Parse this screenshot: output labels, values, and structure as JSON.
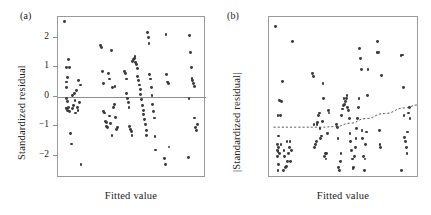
{
  "figure": {
    "background": "#ffffff",
    "point_color": "#3b3b3b",
    "line_color": "#8d8d8d",
    "trend_color": "#5a5a5a"
  },
  "panels": [
    {
      "key": "a",
      "label": "(a)",
      "xlabel": "Fitted value",
      "ylabel": "Standardized residual"
    },
    {
      "key": "b",
      "label": "(b)",
      "xlabel": "Fitted value",
      "ylabel": "|Standardized residual|"
    }
  ],
  "chart_data": [
    {
      "type": "scatter",
      "panel": "(a)",
      "title": "",
      "xlabel": "Fitted value",
      "ylabel": "Standardized residual",
      "xticklabels": [],
      "yticks": [
        -2,
        -1,
        0,
        1,
        2
      ],
      "yticklabels": [
        "−2",
        "−1",
        "0",
        "1",
        "2"
      ],
      "ylim": [
        -2.75,
        2.7
      ],
      "xlim": [
        0,
        1
      ],
      "grid": false,
      "legend": null,
      "reference_line": {
        "type": "horizontal",
        "y": 0,
        "style": "solid"
      },
      "x": [
        0.045,
        0.055,
        0.055,
        0.055,
        0.06,
        0.06,
        0.06,
        0.065,
        0.065,
        0.065,
        0.07,
        0.07,
        0.075,
        0.08,
        0.085,
        0.09,
        0.095,
        0.1,
        0.105,
        0.11,
        0.115,
        0.12,
        0.125,
        0.13,
        0.135,
        0.14,
        0.145,
        0.15,
        0.155,
        0.29,
        0.295,
        0.3,
        0.305,
        0.31,
        0.315,
        0.32,
        0.325,
        0.33,
        0.335,
        0.34,
        0.345,
        0.35,
        0.355,
        0.36,
        0.365,
        0.37,
        0.375,
        0.38,
        0.385,
        0.39,
        0.395,
        0.4,
        0.45,
        0.455,
        0.46,
        0.465,
        0.47,
        0.475,
        0.48,
        0.485,
        0.49,
        0.495,
        0.5,
        0.505,
        0.51,
        0.515,
        0.52,
        0.525,
        0.53,
        0.535,
        0.54,
        0.545,
        0.55,
        0.555,
        0.56,
        0.565,
        0.57,
        0.575,
        0.58,
        0.585,
        0.59,
        0.595,
        0.6,
        0.605,
        0.61,
        0.615,
        0.62,
        0.625,
        0.63,
        0.635,
        0.64,
        0.645,
        0.65,
        0.655,
        0.66,
        0.72,
        0.725,
        0.73,
        0.735,
        0.74,
        0.745,
        0.75,
        0.88,
        0.885,
        0.89,
        0.895,
        0.9,
        0.905,
        0.91,
        0.915,
        0.92,
        0.925,
        0.93,
        0.935,
        0.94
      ],
      "y": [
        2.55,
        0.5,
        0.3,
        -0.4,
        1.0,
        -0.05,
        -0.38,
        0.65,
        -0.15,
        -0.45,
        1.27,
        -0.35,
        1.0,
        -0.5,
        -1.25,
        -1.6,
        0.05,
        -0.4,
        -0.3,
        0.1,
        -0.12,
        -0.55,
        0.2,
        -0.35,
        -0.45,
        0.55,
        -0.2,
        0.4,
        -2.3,
        1.73,
        1.68,
        0.85,
        0.45,
        -0.5,
        -0.55,
        -0.85,
        -0.88,
        -1.0,
        -1.05,
        0.78,
        0.6,
        -0.65,
        -0.9,
        1.56,
        -1.3,
        0.3,
        -0.35,
        -0.25,
        0.35,
        -0.7,
        -1.1,
        -1.05,
        0.85,
        0.8,
        0.6,
        0.1,
        -0.05,
        -0.2,
        -0.35,
        -1.0,
        -1.12,
        -1.18,
        -1.3,
        1.2,
        1.25,
        1.3,
        1.35,
        1.15,
        1.1,
        0.95,
        0.7,
        0.55,
        0.4,
        0.25,
        0.08,
        -0.1,
        -0.3,
        -0.45,
        -0.6,
        -0.78,
        -0.95,
        -1.15,
        -1.3,
        2.17,
        2.0,
        1.8,
        0.75,
        0.6,
        0.3,
        0.05,
        -0.25,
        -0.5,
        -0.72,
        -1.35,
        -1.8,
        -2.1,
        -2.3,
        2.1,
        0.75,
        0.5,
        0.45,
        -1.7,
        -2.05,
        -0.05,
        2.06,
        1.5,
        1.0,
        0.62,
        0.55,
        0.45,
        0.35,
        -0.72,
        -1.05,
        -1.15,
        -0.95,
        -1.6,
        -1.7
      ]
    },
    {
      "type": "scatter",
      "panel": "(b)",
      "title": "",
      "xlabel": "Fitted value",
      "ylabel": "|Standardized residual|",
      "xticklabels": [],
      "yticks": [
        0,
        1,
        2
      ],
      "yticklabels": [
        "0",
        "1",
        "2"
      ],
      "ylim": [
        -0.08,
        2.72
      ],
      "xlim": [
        0,
        1
      ],
      "grid": false,
      "legend": null,
      "trend_line": {
        "style": "dashed",
        "description": "flat then increasing smoother",
        "points": [
          [
            0.03,
            0.78
          ],
          [
            0.2,
            0.78
          ],
          [
            0.35,
            0.78
          ],
          [
            0.45,
            0.79
          ],
          [
            0.55,
            0.85
          ],
          [
            0.65,
            0.93
          ],
          [
            0.78,
            1.02
          ],
          [
            0.92,
            1.12
          ],
          [
            1.0,
            1.17
          ]
        ]
      },
      "x": [
        0.045,
        0.055,
        0.055,
        0.055,
        0.06,
        0.06,
        0.06,
        0.065,
        0.065,
        0.065,
        0.07,
        0.07,
        0.075,
        0.08,
        0.085,
        0.09,
        0.095,
        0.1,
        0.105,
        0.11,
        0.115,
        0.12,
        0.125,
        0.13,
        0.135,
        0.14,
        0.145,
        0.15,
        0.155,
        0.29,
        0.295,
        0.3,
        0.305,
        0.31,
        0.315,
        0.32,
        0.325,
        0.33,
        0.335,
        0.34,
        0.345,
        0.35,
        0.355,
        0.36,
        0.365,
        0.37,
        0.375,
        0.38,
        0.385,
        0.39,
        0.395,
        0.4,
        0.45,
        0.455,
        0.46,
        0.465,
        0.47,
        0.475,
        0.48,
        0.485,
        0.49,
        0.495,
        0.5,
        0.505,
        0.51,
        0.515,
        0.52,
        0.525,
        0.53,
        0.535,
        0.54,
        0.545,
        0.55,
        0.555,
        0.56,
        0.565,
        0.57,
        0.575,
        0.58,
        0.585,
        0.59,
        0.595,
        0.6,
        0.605,
        0.61,
        0.615,
        0.62,
        0.625,
        0.63,
        0.635,
        0.64,
        0.645,
        0.65,
        0.655,
        0.66,
        0.72,
        0.725,
        0.73,
        0.735,
        0.74,
        0.745,
        0.75,
        0.88,
        0.885,
        0.89,
        0.895,
        0.9,
        0.905,
        0.91,
        0.915,
        0.92,
        0.925,
        0.93,
        0.935,
        0.94
      ],
      "y": [
        2.55,
        0.5,
        0.3,
        0.4,
        1.0,
        0.05,
        0.38,
        0.65,
        0.15,
        0.45,
        1.27,
        0.35,
        1.0,
        0.5,
        1.25,
        1.6,
        0.05,
        0.4,
        0.3,
        0.1,
        0.12,
        0.55,
        0.2,
        0.35,
        0.45,
        0.55,
        0.2,
        0.4,
        2.3,
        1.73,
        1.68,
        0.85,
        0.45,
        0.5,
        0.55,
        0.85,
        0.88,
        1.0,
        1.05,
        0.78,
        0.6,
        0.65,
        0.9,
        1.56,
        1.3,
        0.3,
        0.35,
        0.25,
        0.35,
        0.7,
        1.1,
        1.05,
        0.85,
        0.8,
        0.6,
        0.1,
        0.05,
        0.2,
        0.35,
        1.0,
        1.12,
        1.18,
        1.3,
        1.2,
        1.25,
        1.3,
        1.35,
        1.15,
        1.1,
        0.95,
        0.7,
        0.55,
        0.4,
        0.25,
        0.08,
        0.1,
        0.3,
        0.45,
        0.6,
        0.78,
        0.95,
        1.15,
        1.3,
        2.17,
        2.0,
        1.8,
        0.75,
        0.6,
        0.3,
        0.05,
        0.25,
        0.5,
        0.72,
        1.35,
        1.8,
        2.1,
        2.3,
        2.1,
        0.75,
        0.5,
        0.45,
        1.7,
        2.05,
        0.05,
        2.06,
        1.5,
        1.0,
        0.62,
        0.55,
        0.45,
        0.35,
        0.72,
        1.05,
        1.15,
        0.95,
        1.6,
        1.7
      ]
    }
  ]
}
